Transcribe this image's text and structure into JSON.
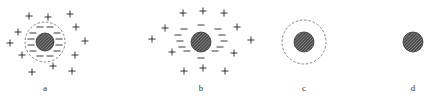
{
  "diagram": {
    "colors": {
      "core_fill": "#4a4a4a",
      "hatch": "#cfcfcf",
      "stroke": "#222222",
      "dashed": "#666666"
    },
    "panels": [
      {
        "label": "a",
        "core": {
          "cx": 45,
          "cy": 42,
          "r": 9
        },
        "dashed_circle": {
          "r": 20
        },
        "minus": [
          [
            40,
            27
          ],
          [
            50,
            27
          ],
          [
            33,
            33
          ],
          [
            57,
            33
          ],
          [
            31,
            39
          ],
          [
            59,
            39
          ],
          [
            31,
            45
          ],
          [
            59,
            45
          ],
          [
            33,
            51
          ],
          [
            57,
            51
          ],
          [
            40,
            56
          ],
          [
            50,
            56
          ]
        ],
        "plus": [
          [
            29,
            16
          ],
          [
            48,
            17
          ],
          [
            70,
            14
          ],
          [
            18,
            32
          ],
          [
            76,
            27
          ],
          [
            10,
            43
          ],
          [
            85,
            41
          ],
          [
            22,
            55
          ],
          [
            75,
            55
          ],
          [
            32,
            72
          ],
          [
            53,
            66
          ],
          [
            72,
            71
          ]
        ]
      },
      {
        "label": "b",
        "core": {
          "cx": 201,
          "cy": 42,
          "r": 10
        },
        "dashed_circle": null,
        "minus": [
          [
            201,
            25
          ],
          [
            184,
            29
          ],
          [
            218,
            29
          ],
          [
            178,
            35
          ],
          [
            222,
            35
          ],
          [
            180,
            41
          ],
          [
            224,
            41
          ],
          [
            182,
            47
          ],
          [
            220,
            47
          ],
          [
            187,
            51
          ],
          [
            215,
            51
          ],
          [
            201,
            58
          ]
        ],
        "plus": [
          [
            183,
            13
          ],
          [
            203,
            11
          ],
          [
            224,
            13
          ],
          [
            165,
            28
          ],
          [
            237,
            27
          ],
          [
            152,
            39
          ],
          [
            251,
            40
          ],
          [
            172,
            52
          ],
          [
            234,
            53
          ],
          [
            184,
            71
          ],
          [
            203,
            68
          ],
          [
            225,
            71
          ]
        ]
      },
      {
        "label": "c",
        "core": {
          "cx": 304,
          "cy": 42,
          "r": 10
        },
        "dashed_circle": {
          "r": 22
        },
        "minus": [],
        "plus": []
      },
      {
        "label": "d",
        "core": {
          "cx": 413,
          "cy": 42,
          "r": 10
        },
        "dashed_circle": null,
        "minus": [],
        "plus": []
      }
    ],
    "labels_y": 91
  }
}
